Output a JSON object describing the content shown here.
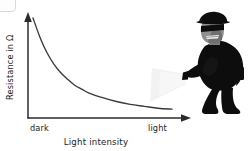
{
  "figure": {
    "background_color": "#ffffff",
    "axis_color": "#2b2b2b",
    "curve_color": "#3a3a3a",
    "text_color": "#222222",
    "y_axis_label": "Resistance in Ω",
    "x_axis_title": "Light intensity",
    "x_tick_left": "dark",
    "x_tick_right": "light",
    "illustration_name": "burglar-with-flashlight",
    "illustration_colors": {
      "clothing": "#0d0d0d",
      "skin": "#8a8a8a",
      "beam": "#f0f0f0"
    }
  },
  "chart_data": {
    "type": "line",
    "title": "",
    "xlabel": "Light intensity",
    "ylabel": "Resistance in Ω",
    "xticklabels": [
      "dark",
      "light"
    ],
    "yticklabels": [],
    "grid": false,
    "legend": null,
    "xlim": [
      0,
      1
    ],
    "ylim": [
      0,
      1
    ],
    "series": [
      {
        "name": "LDR resistance",
        "x": [
          0.0,
          0.05,
          0.1,
          0.15,
          0.2,
          0.25,
          0.3,
          0.35,
          0.4,
          0.5,
          0.6,
          0.7,
          0.8,
          0.9,
          1.0
        ],
        "y": [
          1.0,
          0.8,
          0.64,
          0.52,
          0.43,
          0.36,
          0.3,
          0.26,
          0.22,
          0.17,
          0.13,
          0.1,
          0.08,
          0.06,
          0.05
        ]
      }
    ]
  }
}
